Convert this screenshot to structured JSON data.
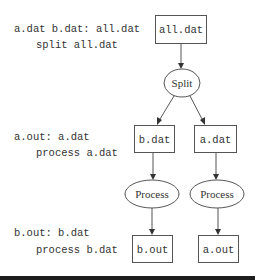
{
  "rules": [
    {
      "target_line": "a.dat b.dat: all.dat",
      "command_line": "split all.dat"
    },
    {
      "target_line": "a.out: a.dat",
      "command_line": "process a.dat"
    },
    {
      "target_line": "b.out: b.dat",
      "command_line": "process b.dat"
    }
  ],
  "nodes": {
    "all_dat": "all.dat",
    "split": "Split",
    "b_dat": "b.dat",
    "a_dat": "a.dat",
    "process_b": "Process",
    "process_a": "Process",
    "b_out": "b.out",
    "a_out": "a.out"
  },
  "edges": [
    {
      "from": "all.dat",
      "to": "Split"
    },
    {
      "from": "Split",
      "to": "b.dat"
    },
    {
      "from": "Split",
      "to": "a.dat"
    },
    {
      "from": "b.dat",
      "to": "Process (b)"
    },
    {
      "from": "a.dat",
      "to": "Process (a)"
    },
    {
      "from": "Process (b)",
      "to": "b.out"
    },
    {
      "from": "Process (a)",
      "to": "a.out"
    }
  ],
  "colors": {
    "stroke": "#555555",
    "text": "#333333",
    "bar": "#1e1e1e"
  }
}
